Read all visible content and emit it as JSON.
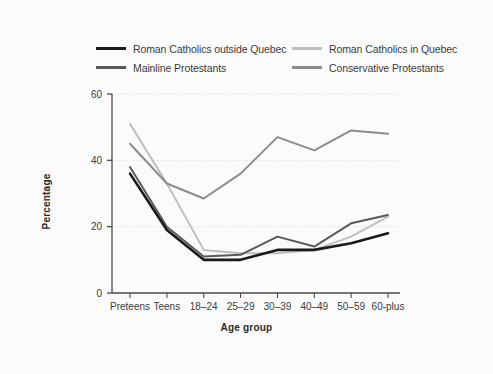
{
  "chart_data": {
    "type": "line",
    "title": "",
    "xlabel": "Age group",
    "ylabel": "Percentage",
    "categories": [
      "Preteens",
      "Teens",
      "18–24",
      "25–29",
      "30–39",
      "40–49",
      "50–59",
      "60-plus"
    ],
    "ylim": [
      0,
      60
    ],
    "yticks": [
      0,
      20,
      40,
      60
    ],
    "ytick_labels": [
      "0",
      "20",
      "40",
      "60"
    ],
    "grid": "horizontal-dotted",
    "legend_position": "top",
    "series": [
      {
        "name": "Roman Catholics outside Quebec",
        "color": "#1a1a1a",
        "values": [
          36,
          19,
          10,
          10,
          13,
          13,
          15,
          18
        ]
      },
      {
        "name": "Roman Catholics in Quebec",
        "color": "#bfbfbf",
        "values": [
          51,
          33,
          13,
          12,
          12,
          13,
          17,
          23
        ]
      },
      {
        "name": "Mainline Protestants",
        "color": "#595959",
        "values": [
          38,
          20,
          11,
          11.5,
          17,
          14,
          21,
          23.5
        ]
      },
      {
        "name": "Conservative Protestants",
        "color": "#8c8c8c",
        "values": [
          45,
          33,
          28.5,
          36,
          47,
          43,
          49,
          48
        ]
      }
    ]
  },
  "legend": {
    "entries": [
      {
        "label": "Roman Catholics outside Quebec",
        "color": "#1a1a1a"
      },
      {
        "label": "Roman Catholics in Quebec",
        "color": "#bfbfbf"
      },
      {
        "label": "Mainline Protestants",
        "color": "#595959"
      },
      {
        "label": "Conservative Protestants",
        "color": "#8c8c8c"
      }
    ]
  },
  "axes": {
    "x_title": "Age group",
    "y_title": "Percentage"
  },
  "colors": {
    "background": "#fbfbfb",
    "axis": "#4a4a4a",
    "grid": "#c8c8c8",
    "text": "#3b3b3b"
  }
}
